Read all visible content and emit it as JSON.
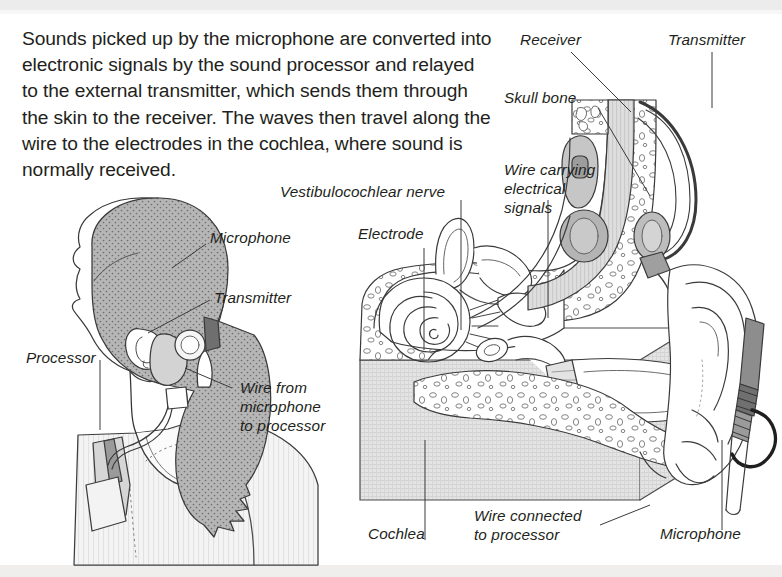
{
  "caption": {
    "text": "Sounds picked up by the microphone are converted into electronic signals by the sound processor and relayed to the external transmitter, which sends them through the skin to the receiver. The waves then travel along the wire to the electrodes in the cochlea, where sound is normally received."
  },
  "left_figure": {
    "name": "woman-profile-with-external-cochlear-implant",
    "labels": [
      {
        "id": "microphone",
        "text": "Microphone"
      },
      {
        "id": "transmitter",
        "text": "Transmitter"
      },
      {
        "id": "processor",
        "text": "Processor"
      },
      {
        "id": "wire-from-microphone",
        "text": "Wire from\nmicrophone\nto processor"
      }
    ]
  },
  "right_figure": {
    "name": "ear-cross-section-with-implant",
    "labels": [
      {
        "id": "receiver",
        "text": "Receiver"
      },
      {
        "id": "transmitter",
        "text": "Transmitter"
      },
      {
        "id": "skull-bone",
        "text": "Skull bone"
      },
      {
        "id": "wire-carrying-electrical-signals",
        "text": "Wire carrying\nelectrical\nsignals"
      },
      {
        "id": "vestibulocochlear-nerve",
        "text": "Vestibulocochlear nerve"
      },
      {
        "id": "electrode",
        "text": "Electrode"
      },
      {
        "id": "cochlea",
        "text": "Cochlea"
      },
      {
        "id": "wire-connected-to-processor",
        "text": "Wire connected\nto processor"
      },
      {
        "id": "microphone",
        "text": "Microphone"
      }
    ]
  },
  "colors": {
    "ink": "#231f20",
    "line": "#3a3a3a",
    "hair_fill": "#a9a9a9",
    "skin_fill": "#ffffff",
    "shirt_fill": "#f2f2f2",
    "bone_fill": "#ffffff",
    "tissue_fill": "#dcdcdc",
    "device_fill": "#8f8f8f",
    "page_band": "#ececec"
  }
}
